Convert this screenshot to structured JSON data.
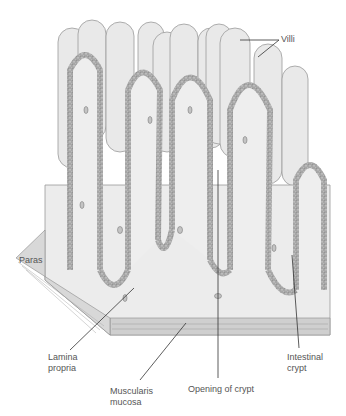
{
  "diagram": {
    "colors": {
      "background": "#ffffff",
      "tissue": "#ececec",
      "villus": "#e6e6e6",
      "epithelium": "#9a9a9a",
      "outline": "#7a7a7a",
      "muscle": "#c8c8c8",
      "leader": "#333333",
      "text": "#555555"
    },
    "labels": [
      {
        "id": "villi",
        "text": "Villi",
        "x": 281,
        "y": 34
      },
      {
        "id": "paras",
        "text": "Paras",
        "x": 19,
        "y": 255
      },
      {
        "id": "lamina-propria",
        "text": "Lamina\npropria",
        "x": 48,
        "y": 352
      },
      {
        "id": "muscularis-mucosa",
        "text": "Muscularis\nmucosa",
        "x": 110,
        "y": 386
      },
      {
        "id": "opening-of-crypt",
        "text": "Opening of crypt",
        "x": 188,
        "y": 384
      },
      {
        "id": "intestinal-crypt",
        "text": "Intestinal\ncrypt",
        "x": 287,
        "y": 352
      }
    ]
  }
}
